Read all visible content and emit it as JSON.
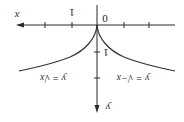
{
  "diagram": {
    "orientation": "rotated-180",
    "axes": {
      "x_label": "x",
      "y_label": "y",
      "origin_label": "0",
      "x_tick_label": "1",
      "y_tick_label": "1"
    },
    "curves": [
      {
        "id": "sqrt-x",
        "label": "y = √x"
      },
      {
        "id": "sqrt-neg-x",
        "label": "y = √−x"
      }
    ],
    "colors": {
      "line": "#2a2a2a",
      "background": "#ffffff"
    }
  }
}
